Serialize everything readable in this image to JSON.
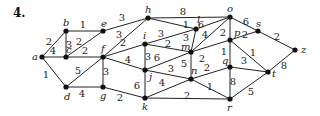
{
  "problem_number": "4.",
  "graph": {
    "nodes": [
      {
        "id": "a",
        "x": 42,
        "y": 57,
        "lx": -10,
        "ly": 3
      },
      {
        "id": "b",
        "x": 66,
        "y": 31,
        "lx": -3,
        "ly": -5
      },
      {
        "id": "c",
        "x": 66,
        "y": 57,
        "lx": 0,
        "ly": -4
      },
      {
        "id": "d",
        "x": 66,
        "y": 87,
        "lx": -2,
        "ly": 13
      },
      {
        "id": "e",
        "x": 103,
        "y": 31,
        "lx": -2,
        "ly": -4
      },
      {
        "id": "f",
        "x": 103,
        "y": 57,
        "lx": -2,
        "ly": -5
      },
      {
        "id": "g",
        "x": 103,
        "y": 87,
        "lx": -3,
        "ly": 12
      },
      {
        "id": "h",
        "x": 148,
        "y": 18,
        "lx": -3,
        "ly": -5
      },
      {
        "id": "i",
        "x": 145,
        "y": 44,
        "lx": -2,
        "ly": -5
      },
      {
        "id": "j",
        "x": 145,
        "y": 70,
        "lx": 4,
        "ly": 10
      },
      {
        "id": "k",
        "x": 145,
        "y": 98,
        "lx": -3,
        "ly": 12
      },
      {
        "id": "l",
        "x": 196,
        "y": 29,
        "lx": 1,
        "ly": -6
      },
      {
        "id": "m",
        "x": 191,
        "y": 52,
        "lx": -10,
        "ly": -2
      },
      {
        "id": "n",
        "x": 191,
        "y": 79,
        "lx": 0,
        "ly": -5
      },
      {
        "id": "o",
        "x": 230,
        "y": 17,
        "lx": -3,
        "ly": -5
      },
      {
        "id": "p",
        "x": 230,
        "y": 40,
        "lx": 4,
        "ly": -4
      },
      {
        "id": "q",
        "x": 230,
        "y": 67,
        "lx": -8,
        "ly": -3
      },
      {
        "id": "r",
        "x": 230,
        "y": 99,
        "lx": -3,
        "ly": 12
      },
      {
        "id": "s",
        "x": 258,
        "y": 31,
        "lx": -2,
        "ly": -4
      },
      {
        "id": "t",
        "x": 268,
        "y": 72,
        "lx": 4,
        "ly": 5
      },
      {
        "id": "z",
        "x": 295,
        "y": 50,
        "lx": 6,
        "ly": 3
      }
    ],
    "edges": [
      {
        "from": "a",
        "to": "b",
        "w": "2",
        "lx": 49,
        "ly": 45
      },
      {
        "from": "a",
        "to": "c",
        "w": "4",
        "lx": 53,
        "ly": 54
      },
      {
        "from": "a",
        "to": "d",
        "w": "1",
        "lx": 46,
        "ly": 78
      },
      {
        "from": "b",
        "to": "e",
        "w": "1",
        "lx": 83,
        "ly": 28
      },
      {
        "from": "b",
        "to": "c",
        "w": "3",
        "lx": 69,
        "ly": 48
      },
      {
        "from": "c",
        "to": "e",
        "w": "2",
        "lx": 79,
        "ly": 45
      },
      {
        "from": "c",
        "to": "f",
        "w": "2",
        "lx": 85,
        "ly": 54
      },
      {
        "from": "d",
        "to": "f",
        "w": "5",
        "lx": 78,
        "ly": 74
      },
      {
        "from": "d",
        "to": "g",
        "w": "4",
        "lx": 82,
        "ly": 97
      },
      {
        "from": "f",
        "to": "g",
        "w": "3",
        "lx": 106,
        "ly": 75
      },
      {
        "from": "e",
        "to": "h",
        "w": "3",
        "lx": 122,
        "ly": 21
      },
      {
        "from": "f",
        "to": "h",
        "w": "3",
        "lx": 119,
        "ly": 38
      },
      {
        "from": "f",
        "to": "i",
        "w": "2",
        "lx": 123,
        "ly": 46
      },
      {
        "from": "f",
        "to": "j",
        "w": "4",
        "lx": 128,
        "ly": 63
      },
      {
        "from": "g",
        "to": "k",
        "w": "2",
        "lx": 120,
        "ly": 101
      },
      {
        "from": "h",
        "to": "o",
        "w": "8",
        "lx": 183,
        "ly": 15
      },
      {
        "from": "h",
        "to": "l",
        "w": "1",
        "lx": 186,
        "ly": 28
      },
      {
        "from": "i",
        "to": "l",
        "w": "3",
        "lx": 161,
        "ly": 37
      },
      {
        "from": "i",
        "to": "m",
        "w": "2",
        "lx": 168,
        "ly": 47
      },
      {
        "from": "i",
        "to": "j",
        "w": "3",
        "lx": 148,
        "ly": 60
      },
      {
        "from": "j",
        "to": "m",
        "w": "6",
        "lx": 157,
        "ly": 61
      },
      {
        "from": "j",
        "to": "k",
        "w": "6",
        "lx": 137,
        "ly": 89
      },
      {
        "from": "j",
        "to": "n",
        "w": "3",
        "lx": 171,
        "ly": 72
      },
      {
        "from": "k",
        "to": "n",
        "w": "4",
        "lx": 162,
        "ly": 86
      },
      {
        "from": "k",
        "to": "r",
        "w": "2",
        "lx": 187,
        "ly": 99
      },
      {
        "from": "l",
        "to": "m",
        "w": "3",
        "lx": 186,
        "ly": 41
      },
      {
        "from": "l",
        "to": "o",
        "w": "6",
        "lx": 201,
        "ly": 28
      },
      {
        "from": "m",
        "to": "o",
        "w": "4",
        "lx": 205,
        "ly": 38
      },
      {
        "from": "m",
        "to": "n",
        "w": "5",
        "lx": 184,
        "ly": 67
      },
      {
        "from": "m",
        "to": "p",
        "w": "2",
        "lx": 202,
        "ly": 62
      },
      {
        "from": "o",
        "to": "p",
        "w": "2",
        "lx": 223,
        "ly": 36
      },
      {
        "from": "o",
        "to": "s",
        "w": "6",
        "lx": 246,
        "ly": 25
      },
      {
        "from": "p",
        "to": "s",
        "w": "2",
        "lx": 245,
        "ly": 38
      },
      {
        "from": "s",
        "to": "z",
        "w": "2",
        "lx": 277,
        "ly": 40
      },
      {
        "from": "p",
        "to": "q",
        "w": "1",
        "lx": 224,
        "ly": 55
      },
      {
        "from": "p",
        "to": "t",
        "w": "1",
        "lx": 253,
        "ly": 56
      },
      {
        "from": "n",
        "to": "q",
        "w": "2",
        "lx": 207,
        "ly": 71
      },
      {
        "from": "n",
        "to": "r",
        "w": "1",
        "lx": 210,
        "ly": 90
      },
      {
        "from": "q",
        "to": "t",
        "w": "3",
        "lx": 244,
        "ly": 64
      },
      {
        "from": "q",
        "to": "r",
        "w": "8",
        "lx": 233,
        "ly": 85
      },
      {
        "from": "r",
        "to": "t",
        "w": "5",
        "lx": 251,
        "ly": 95
      },
      {
        "from": "t",
        "to": "z",
        "w": "8",
        "lx": 284,
        "ly": 69
      }
    ]
  }
}
